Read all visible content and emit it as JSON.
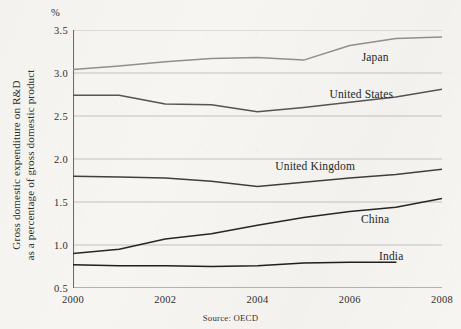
{
  "figure": {
    "percent_symbol": "%",
    "y_axis_title_line1": "Gross domestic expenditure on R&D",
    "y_axis_title_line2": "as a percentage of gross domestic product",
    "source_note": "Source: OECD"
  },
  "chart_data": {
    "type": "line",
    "title": "",
    "xlabel": "",
    "ylabel": "Gross domestic expenditure on R&D as a percentage of gross domestic product",
    "unit": "%",
    "source": "Source: OECD",
    "grid": true,
    "legend_position": "inline-right",
    "xlim": [
      2000,
      2008
    ],
    "ylim": [
      0.5,
      3.5
    ],
    "yticks": [
      0.5,
      1.0,
      1.5,
      2.0,
      2.5,
      3.0,
      3.5
    ],
    "ytick_labels": [
      "0.5",
      "1.0",
      "1.5",
      "2.0",
      "2.5",
      "3.0",
      "3.5"
    ],
    "xticks": [
      2000,
      2001,
      2002,
      2003,
      2004,
      2005,
      2006,
      2007,
      2008
    ],
    "xtick_labels_shown": [
      "2000",
      "2002",
      "2004",
      "2006",
      "2008"
    ],
    "x": [
      2000,
      2001,
      2002,
      2003,
      2004,
      2005,
      2006,
      2007,
      2008
    ],
    "series": [
      {
        "name": "Japan",
        "color": "#8f8f8f",
        "label_x": 2006.55,
        "label_y": 3.19,
        "values": [
          3.04,
          3.08,
          3.13,
          3.17,
          3.18,
          3.15,
          3.32,
          3.4,
          3.42
        ]
      },
      {
        "name": "United States",
        "color": "#545454",
        "label_x": 2006.25,
        "label_y": 2.76,
        "values": [
          2.74,
          2.74,
          2.64,
          2.63,
          2.55,
          2.6,
          2.66,
          2.72,
          2.81
        ]
      },
      {
        "name": "United Kingdom",
        "color": "#3f3f3f",
        "label_x": 2005.25,
        "label_y": 1.92,
        "values": [
          1.8,
          1.79,
          1.78,
          1.74,
          1.68,
          1.73,
          1.78,
          1.82,
          1.88
        ]
      },
      {
        "name": "China",
        "color": "#262626",
        "label_x": 2006.55,
        "label_y": 1.3,
        "values": [
          0.9,
          0.95,
          1.07,
          1.13,
          1.23,
          1.32,
          1.39,
          1.44,
          1.54
        ]
      },
      {
        "name": "India",
        "color": "#1f1f1f",
        "label_x": 2006.9,
        "label_y": 0.87,
        "values": [
          0.77,
          0.76,
          0.76,
          0.75,
          0.76,
          0.79,
          0.8,
          0.8,
          null
        ]
      }
    ]
  }
}
